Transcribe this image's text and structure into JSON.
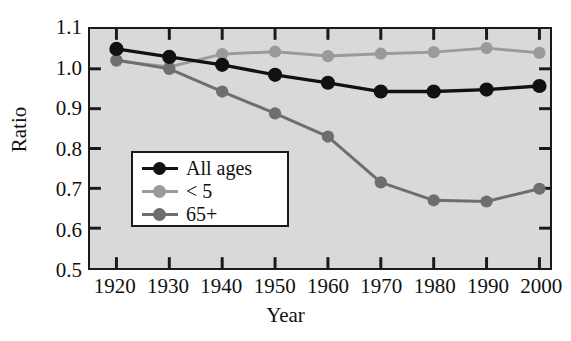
{
  "chart_data": {
    "type": "line",
    "title": "",
    "xlabel": "Year",
    "ylabel": "Ratio",
    "categories": [
      1920,
      1930,
      1940,
      1950,
      1960,
      1970,
      1980,
      1990,
      2000
    ],
    "x": [
      1920,
      1930,
      1940,
      1950,
      1960,
      1970,
      1980,
      1990,
      2000
    ],
    "xlim": [
      1915,
      2002
    ],
    "ylim": [
      0.5,
      1.1
    ],
    "yticks": [
      "0.5",
      "0.6",
      "0.7",
      "0.8",
      "0.9",
      "1.0",
      "1.1"
    ],
    "ytick_values": [
      0.5,
      0.6,
      0.7,
      0.8,
      0.9,
      1.0,
      1.1
    ],
    "xticks": [
      "1920",
      "1930",
      "1940",
      "1950",
      "1960",
      "1970",
      "1980",
      "1990",
      "2000"
    ],
    "grid": false,
    "legend_position": "center-left",
    "plot_background": "#d9d9d9",
    "series": [
      {
        "name": "All ages",
        "color": "#111111",
        "values": [
          1.05,
          1.03,
          1.01,
          0.985,
          0.965,
          0.943,
          0.943,
          0.948,
          0.957
        ]
      },
      {
        "name": "< 5",
        "color": "#9a9a9a",
        "values": [
          1.02,
          1.005,
          1.037,
          1.043,
          1.032,
          1.038,
          1.042,
          1.052,
          1.04
        ]
      },
      {
        "name": "65+",
        "color": "#6e6e6e",
        "values": [
          1.022,
          1.0,
          0.943,
          0.888,
          0.83,
          0.715,
          0.67,
          0.667,
          0.699
        ]
      }
    ]
  },
  "legend": {
    "items": [
      {
        "label": "All ages",
        "color": "#111111"
      },
      {
        "label": "< 5",
        "color": "#9a9a9a"
      },
      {
        "label": "65+",
        "color": "#6e6e6e"
      }
    ]
  }
}
